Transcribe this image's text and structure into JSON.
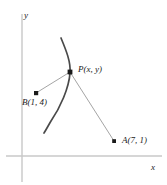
{
  "figure": {
    "type": "coordinate-plane-diagram",
    "width": 167,
    "height": 185,
    "background_color": "#ffffff"
  },
  "axes": {
    "y_axis_label": "y",
    "x_axis_label": "x",
    "axis_color": "#c8c8c8",
    "origin": {
      "x": 22,
      "y": 156
    },
    "y_axis": {
      "x": 22,
      "y_top": 14,
      "y_bottom": 182
    },
    "x_axis": {
      "y": 156,
      "x_left": 6,
      "x_right": 162
    }
  },
  "points": [
    {
      "id": "P",
      "label": "P(x, y)",
      "marker_x": 70,
      "marker_y": 72,
      "marker_color": "#1a1a1a"
    },
    {
      "id": "B",
      "label": "B(1, 4)",
      "marker_x": 36,
      "marker_y": 93,
      "marker_color": "#1a1a1a"
    },
    {
      "id": "A",
      "label": "A(7, 1)",
      "marker_x": 114,
      "marker_y": 141,
      "marker_color": "#1a1a1a"
    }
  ],
  "segments": [
    {
      "id": "PB",
      "from": "P",
      "to": "B",
      "color": "#9a9a9a"
    },
    {
      "id": "PA",
      "from": "P",
      "to": "A",
      "color": "#9a9a9a"
    }
  ],
  "curve": {
    "id": "hyperbola-branch",
    "color": "#4a4a4a",
    "path": "M 61,38 C 66,50 71,62 70,73 C 69,88 60,108 51,121 C 48,126 46,130 44,133",
    "description": "curve through P opening to the left"
  }
}
